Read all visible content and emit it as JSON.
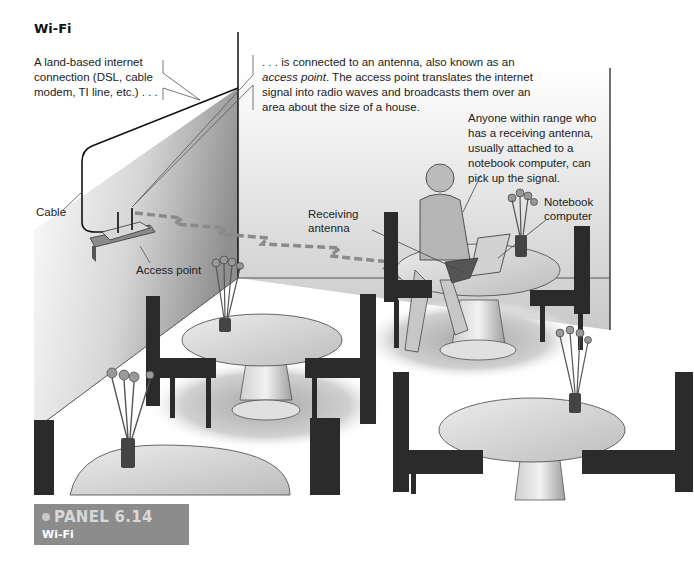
{
  "figure": {
    "title": "Wi-Fi",
    "callouts": {
      "land_connection": [
        "A land-based internet",
        "connection (DSL, cable",
        "modem, TI line, etc.) . . ."
      ],
      "access_point_intro": ". . . is connected to an antenna, also known as an",
      "access_point_term": "access point",
      "access_point_rest_1": ". The access point translates the internet",
      "access_point_rest_2": "signal into radio waves and broadcasts them over an",
      "access_point_rest_3": "area about the size of a house.",
      "anyone": [
        "Anyone within range who",
        "has a receiving antenna,",
        "usually attached to a",
        "notebook computer, can",
        "pick up the signal."
      ]
    },
    "labels": {
      "cable": "Cable",
      "access_point": "Access point",
      "receiving_antenna": [
        "Receiving",
        "antenna"
      ],
      "notebook_computer": [
        "Notebook",
        "computer"
      ]
    },
    "colors": {
      "wall_light": "#f4f4f4",
      "wall_dark": "#9a9a9a",
      "signal_dash": "#8a8a8a",
      "caption_bg": "#8c8c8c",
      "caption_title": "#d8d8d8",
      "furniture_dark": "#2b2b2b"
    }
  },
  "caption": {
    "panel": "PANEL 6.14",
    "subtitle": "Wi-Fi"
  }
}
